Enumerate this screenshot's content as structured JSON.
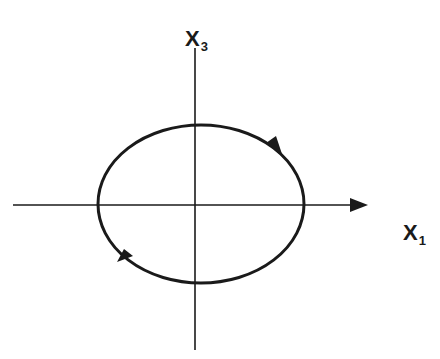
{
  "diagram": {
    "type": "phase-portrait",
    "axes": {
      "vertical": {
        "label": "X",
        "subscript": "3"
      },
      "horizontal": {
        "label": "X",
        "subscript": "1"
      }
    },
    "orbit": {
      "shape": "closed-ellipse",
      "direction": "clockwise",
      "arrows": 2
    },
    "colors": {
      "stroke": "#1a1a1a",
      "background": "#ffffff"
    }
  }
}
